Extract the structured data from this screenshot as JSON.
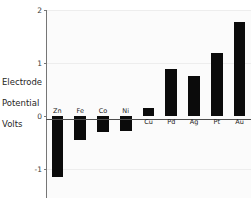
{
  "chart_data": {
    "type": "bar",
    "title": "",
    "xlabel": "",
    "ylabel": "Electrode\nPotential\nVolts",
    "categories": [
      "Zn",
      "Fe",
      "Co",
      "Ni",
      "Cu",
      "Pd",
      "Ag",
      "Pt",
      "Au"
    ],
    "values": [
      -1.15,
      -0.45,
      -0.3,
      -0.28,
      0.15,
      0.89,
      0.76,
      1.18,
      1.78
    ],
    "ylim": [
      -1.55,
      2.0
    ],
    "yticks": [
      2,
      1,
      0,
      -1
    ],
    "ytick_labels": [
      "2",
      "1",
      "0",
      "-1"
    ],
    "grid": true,
    "legend": null,
    "bar_color": "#0b0b0b",
    "axis_color": "#767676",
    "grid_color": "#ededed",
    "plot_background": "#fbfbfb"
  },
  "axis_title": {
    "line1": "Electrode",
    "line2": "Potential",
    "line3": "Volts"
  }
}
